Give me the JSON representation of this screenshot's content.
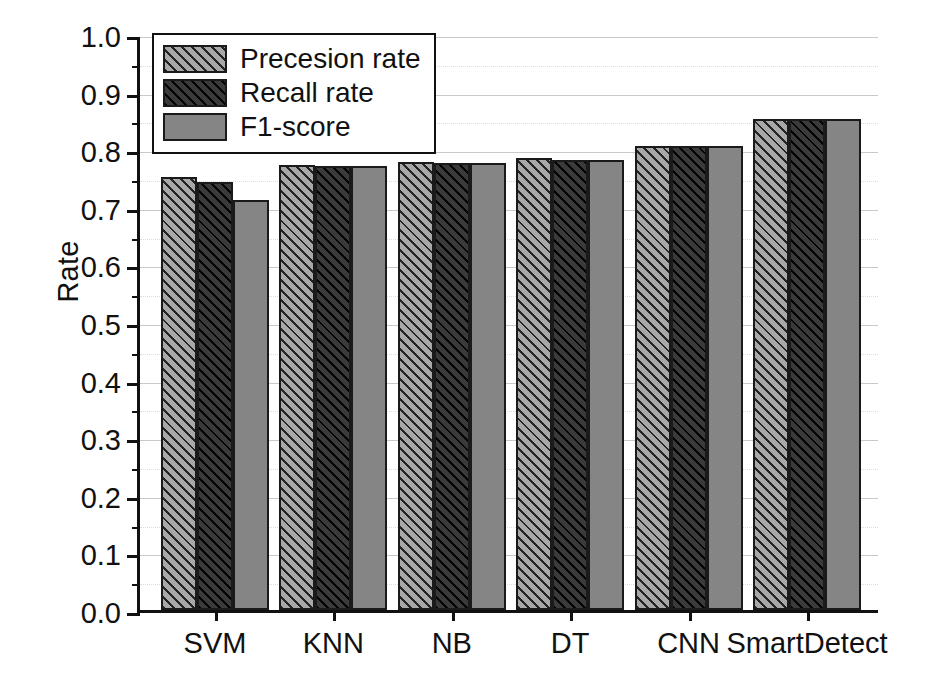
{
  "chart_data": {
    "type": "bar",
    "title": "",
    "xlabel": "",
    "ylabel": "Rate",
    "ylim": [
      0.0,
      1.0
    ],
    "ytick_step": 0.1,
    "yminor_step": 0.05,
    "grid": "horizontal major solid + minor dotted",
    "legend_position": "top-left inside",
    "categories": [
      "SVM",
      "KNN",
      "NB",
      "DT",
      "CNN",
      "SmartDetect"
    ],
    "ytick_labels": [
      "0.0",
      "0.1",
      "0.2",
      "0.3",
      "0.4",
      "0.5",
      "0.6",
      "0.7",
      "0.8",
      "0.9",
      "1.0"
    ],
    "series": [
      {
        "name": "Precesion rate",
        "pattern": "hatch-light",
        "color": "#a8a8a8",
        "values": [
          0.752,
          0.772,
          0.777,
          0.784,
          0.806,
          0.852
        ]
      },
      {
        "name": "Recall rate",
        "pattern": "hatch-dark",
        "color": "#3a3a3a",
        "values": [
          0.743,
          0.771,
          0.776,
          0.782,
          0.805,
          0.852
        ]
      },
      {
        "name": "F1-score",
        "pattern": "solid-mid",
        "color": "#858585",
        "values": [
          0.712,
          0.771,
          0.776,
          0.782,
          0.805,
          0.852
        ]
      }
    ]
  }
}
